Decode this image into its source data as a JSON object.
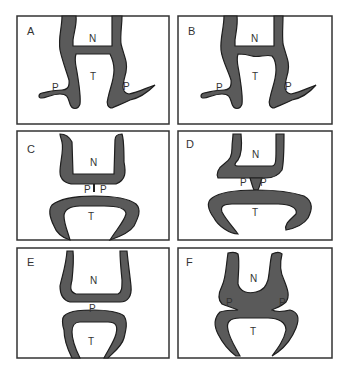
{
  "figure": {
    "colors": {
      "band_fill": "#5a5a5a",
      "band_stroke": "#1e1e1e",
      "panel_border": "#333333",
      "background": "#ffffff",
      "label": "#333333"
    },
    "panels": [
      {
        "id": "A",
        "label": "A",
        "regions": {
          "N": "N",
          "T": "T",
          "P_left": "P",
          "P_right": "P"
        }
      },
      {
        "id": "B",
        "label": "B",
        "regions": {
          "N": "N",
          "T": "T",
          "P_left": "P",
          "P_right": "P"
        }
      },
      {
        "id": "C",
        "label": "C",
        "regions": {
          "N": "N",
          "T": "T",
          "P_left": "P",
          "P_right": "P"
        }
      },
      {
        "id": "D",
        "label": "D",
        "regions": {
          "N": "N",
          "T": "T",
          "P_left": "P",
          "P_right": "P"
        }
      },
      {
        "id": "E",
        "label": "E",
        "regions": {
          "N": "N",
          "T": "T",
          "P": "P"
        }
      },
      {
        "id": "F",
        "label": "F",
        "regions": {
          "N": "N",
          "T": "T",
          "P_left": "P",
          "P_right": "P"
        }
      }
    ]
  }
}
